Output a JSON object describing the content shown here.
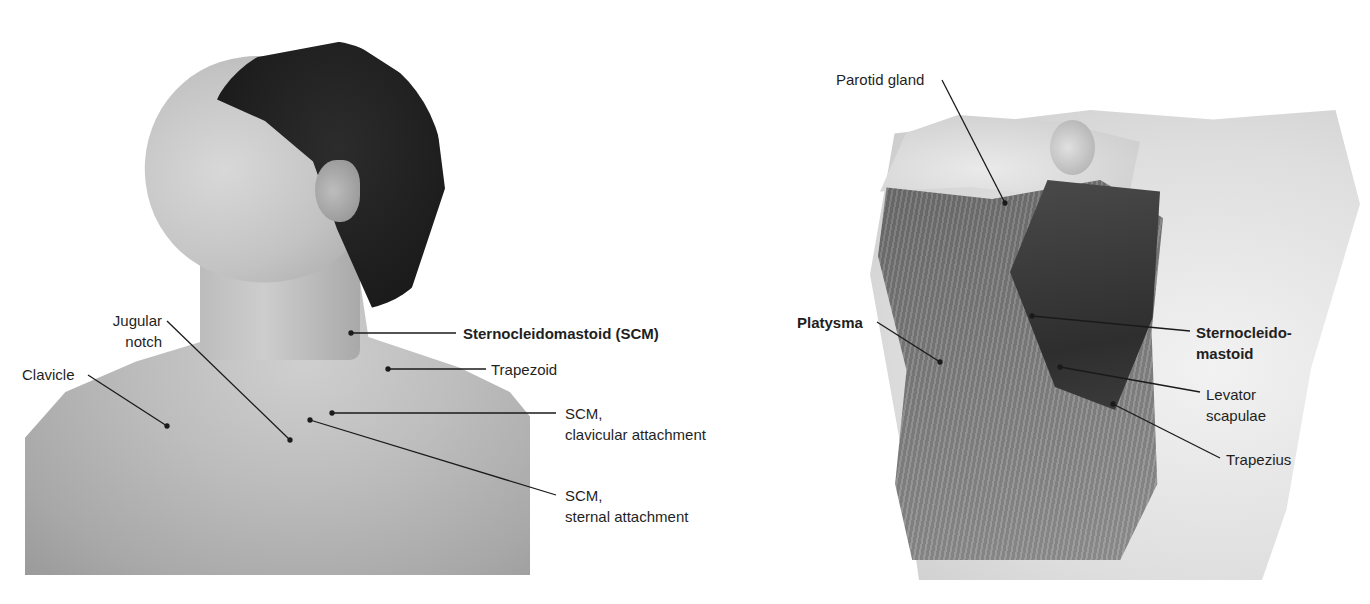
{
  "figure": {
    "left_panel": {
      "type": "photo",
      "subject": "male neck and shoulder, head turned to the left",
      "labels": [
        {
          "id": "jugular-notch",
          "text": "Jugular\nnotch",
          "bold": false
        },
        {
          "id": "clavicle",
          "text": "Clavicle",
          "bold": false
        },
        {
          "id": "scm",
          "text": "Sternocleidomastoid (SCM)",
          "bold": true
        },
        {
          "id": "trapezoid",
          "text": "Trapezoid",
          "bold": false
        },
        {
          "id": "scm-clavicular",
          "text": "SCM,\nclavicular attachment",
          "bold": false
        },
        {
          "id": "scm-sternal",
          "text": "SCM,\nsternal attachment",
          "bold": false
        }
      ]
    },
    "right_panel": {
      "type": "illustration",
      "subject": "anatomical drawing of neck muscles",
      "labels": [
        {
          "id": "parotid-gland",
          "text": "Parotid gland",
          "bold": false
        },
        {
          "id": "platysma",
          "text": "Platysma",
          "bold": true
        },
        {
          "id": "sternocleidomastoid",
          "text": "Sternocleido-\nmastoid",
          "bold": true
        },
        {
          "id": "levator-scapulae",
          "text": "Levator\nscapulae",
          "bold": false
        },
        {
          "id": "trapezius",
          "text": "Trapezius",
          "bold": false
        }
      ]
    },
    "colors": {
      "background": "#ffffff",
      "text": "#1f1f1f",
      "leader_line": "#1a1a1a"
    }
  }
}
